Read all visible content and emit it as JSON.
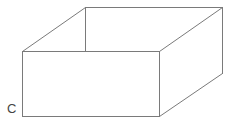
{
  "diagram": {
    "title": "",
    "kind": "open-box",
    "stroke_color": "#7a7a7a",
    "stroke_width": 1,
    "vertices": {
      "front_top_left": [
        22,
        51
      ],
      "front_top_right": [
        159,
        51
      ],
      "front_bottom_right": [
        159,
        116
      ],
      "front_bottom_left": [
        22,
        116
      ],
      "back_top_left": [
        85,
        7
      ],
      "back_top_right": [
        222,
        7
      ],
      "back_bottom_right": [
        222,
        73
      ],
      "back_hidden_left_visible_end": [
        85,
        51
      ]
    },
    "labels": [
      {
        "id": "C",
        "text": "C",
        "x": 7,
        "y": 102
      }
    ]
  }
}
